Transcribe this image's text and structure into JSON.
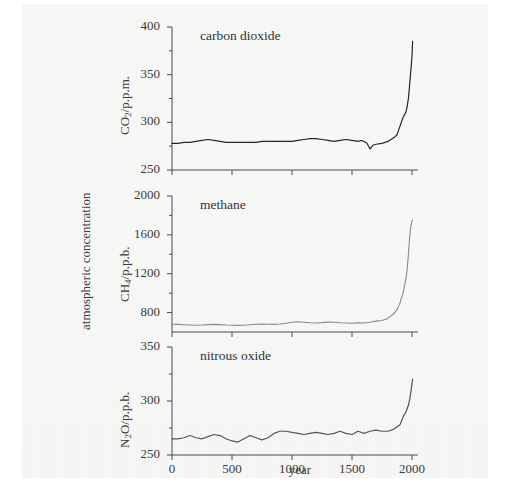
{
  "figure": {
    "x_axis_label": "year",
    "shared_y_axis_label": "atmospheric concentration"
  },
  "chart_data": [
    {
      "type": "line",
      "title": "carbon dioxide",
      "panel_label": "carbon dioxide",
      "xlabel": "year",
      "ylabel": "CO2/p.p.m.",
      "ylabel_base": "CO",
      "ylabel_sub": "2",
      "ylabel_rest": "/p.p.m.",
      "xlim": [
        0,
        2050
      ],
      "ylim": [
        250,
        400
      ],
      "xticks": [
        0,
        500,
        1000,
        1500,
        2000
      ],
      "yticks": [
        250,
        300,
        350,
        400
      ],
      "ytick_labels": [
        "250",
        "300",
        "350",
        "400"
      ],
      "minor_yticks": [
        275,
        325,
        375
      ],
      "grid": false,
      "legend": "none",
      "line_color": "#262626",
      "x": [
        0,
        50,
        100,
        150,
        200,
        250,
        300,
        350,
        400,
        450,
        500,
        550,
        600,
        650,
        700,
        750,
        800,
        850,
        900,
        950,
        1000,
        1050,
        1100,
        1150,
        1200,
        1250,
        1300,
        1350,
        1400,
        1450,
        1500,
        1550,
        1575,
        1600,
        1625,
        1650,
        1675,
        1700,
        1750,
        1800,
        1850,
        1875,
        1900,
        1925,
        1950,
        1960,
        1970,
        1980,
        1990,
        2000,
        2005
      ],
      "values": [
        278,
        278,
        279,
        279,
        280,
        281,
        282,
        281,
        280,
        279,
        279,
        279,
        279,
        279,
        279,
        280,
        280,
        280,
        280,
        280,
        280,
        281,
        282,
        283,
        283,
        282,
        281,
        280,
        281,
        282,
        281,
        280,
        281,
        280,
        278,
        272,
        276,
        277,
        278,
        280,
        284,
        287,
        296,
        305,
        311,
        317,
        325,
        339,
        354,
        369,
        385
      ]
    },
    {
      "type": "line",
      "title": "methane",
      "panel_label": "methane",
      "xlabel": "year",
      "ylabel": "CH4/p.p.b.",
      "ylabel_base": "CH",
      "ylabel_sub": "4",
      "ylabel_rest": "/p.p.b.",
      "xlim": [
        0,
        2050
      ],
      "ylim": [
        600,
        2000
      ],
      "xticks": [
        0,
        500,
        1000,
        1500,
        2000
      ],
      "yticks": [
        800,
        1200,
        1600,
        2000
      ],
      "ytick_labels": [
        "800",
        "1200",
        "1600",
        "2000"
      ],
      "minor_yticks": [
        1000,
        1400,
        1800
      ],
      "grid": false,
      "legend": "none",
      "line_color": "#8a8a8a",
      "x": [
        0,
        50,
        100,
        150,
        200,
        250,
        300,
        350,
        400,
        450,
        500,
        550,
        600,
        650,
        700,
        750,
        800,
        850,
        900,
        950,
        1000,
        1050,
        1100,
        1150,
        1200,
        1250,
        1300,
        1350,
        1400,
        1450,
        1500,
        1550,
        1600,
        1650,
        1700,
        1750,
        1800,
        1850,
        1875,
        1900,
        1925,
        1950,
        1960,
        1970,
        1980,
        1990,
        2000,
        2005
      ],
      "values": [
        680,
        678,
        675,
        672,
        670,
        672,
        676,
        678,
        676,
        672,
        670,
        668,
        670,
        675,
        680,
        682,
        680,
        678,
        682,
        690,
        700,
        705,
        700,
        695,
        692,
        696,
        702,
        700,
        695,
        692,
        690,
        695,
        692,
        700,
        712,
        718,
        740,
        790,
        830,
        900,
        1000,
        1150,
        1250,
        1400,
        1570,
        1690,
        1745,
        1750
      ]
    },
    {
      "type": "line",
      "title": "nitrous oxide",
      "panel_label": "nitrous oxide",
      "xlabel": "year",
      "ylabel": "N2O/p.p.b.",
      "ylabel_base": "N",
      "ylabel_sub": "2",
      "ylabel_rest": "O/p.p.b.",
      "xlim": [
        0,
        2050
      ],
      "ylim": [
        250,
        350
      ],
      "xticks": [
        0,
        500,
        1000,
        1500,
        2000
      ],
      "yticks": [
        250,
        300,
        350
      ],
      "ytick_labels": [
        "250",
        "300",
        "350"
      ],
      "minor_yticks": [
        275,
        325
      ],
      "grid": false,
      "legend": "none",
      "line_color": "#555555",
      "x": [
        0,
        50,
        100,
        150,
        200,
        250,
        300,
        350,
        400,
        450,
        500,
        550,
        600,
        650,
        700,
        750,
        800,
        850,
        900,
        950,
        1000,
        1050,
        1100,
        1150,
        1200,
        1250,
        1300,
        1350,
        1400,
        1450,
        1500,
        1550,
        1600,
        1650,
        1700,
        1750,
        1800,
        1850,
        1875,
        1900,
        1925,
        1950,
        1960,
        1970,
        1980,
        1990,
        2000,
        2005
      ],
      "values": [
        265,
        265,
        266,
        268,
        266,
        265,
        267,
        269,
        268,
        265,
        263,
        262,
        265,
        268,
        266,
        264,
        266,
        270,
        272,
        272,
        271,
        270,
        269,
        270,
        271,
        270,
        269,
        270,
        272,
        270,
        269,
        272,
        270,
        272,
        273,
        272,
        272,
        274,
        276,
        278,
        285,
        290,
        293,
        296,
        301,
        308,
        316,
        320
      ]
    }
  ],
  "x_tick_labels": [
    "0",
    "500",
    "1000",
    "1500",
    "2000"
  ]
}
